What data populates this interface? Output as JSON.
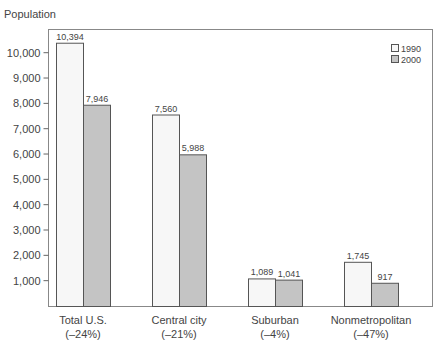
{
  "chart_data": {
    "type": "bar",
    "title": "",
    "ylabel": "Population",
    "xlabel": "",
    "ylim": [
      0,
      11000
    ],
    "yticks": [
      1000,
      2000,
      3000,
      4000,
      5000,
      6000,
      7000,
      8000,
      9000,
      10000
    ],
    "ytick_labels": [
      "1,000",
      "2,000",
      "3,000",
      "4,000",
      "5,000",
      "6,000",
      "7,000",
      "8,000",
      "9,000",
      "10,000"
    ],
    "categories": [
      "Total U.S.",
      "Central city",
      "Suburban",
      "Nonmetropolitan"
    ],
    "category_sublabels": [
      "(–24%)",
      "(–21%)",
      "(–4%)",
      "(–47%)"
    ],
    "series": [
      {
        "name": "1990",
        "color": "#f7f7f7",
        "values": [
          10394,
          7560,
          1089,
          1745
        ],
        "labels": [
          "10,394",
          "7,560",
          "1,089",
          "1,745"
        ]
      },
      {
        "name": "2000",
        "color": "#c4c4c4",
        "values": [
          7946,
          5988,
          1041,
          917
        ],
        "labels": [
          "7,946",
          "5,988",
          "1,041",
          "917"
        ]
      }
    ],
    "legend_position": "top-right",
    "grid": false
  }
}
